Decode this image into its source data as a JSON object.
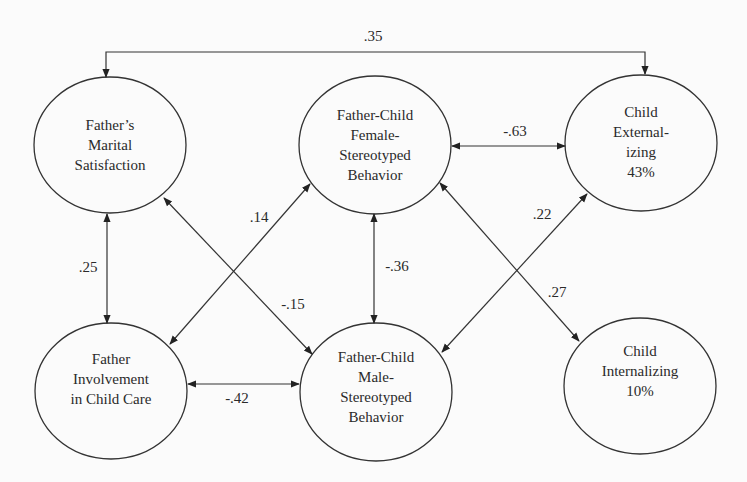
{
  "diagram": {
    "type": "path-model",
    "nodes": [
      {
        "id": "marital",
        "lines": [
          "Father’s",
          "Marital",
          "Satisfaction"
        ],
        "cx": 110,
        "cy": 145
      },
      {
        "id": "female",
        "lines": [
          "Father-Child",
          "Female-",
          "Stereotyped",
          "Behavior"
        ],
        "cx": 375,
        "cy": 145
      },
      {
        "id": "externalizing",
        "lines": [
          "Child",
          "External-",
          "izing",
          "43%"
        ],
        "cx": 641,
        "cy": 146
      },
      {
        "id": "involvement",
        "lines": [
          "Father",
          "Involvement",
          "in Child Care"
        ],
        "cx": 111,
        "cy": 390
      },
      {
        "id": "male",
        "lines": [
          "Father-Child",
          "Male-",
          "Stereotyped",
          "Behavior"
        ],
        "cx": 376,
        "cy": 390
      },
      {
        "id": "internalizing",
        "lines": [
          "Child",
          "Internalizing",
          "10%"
        ],
        "cx": 641,
        "cy": 385
      }
    ],
    "edges": [
      {
        "from": "marital",
        "to": "externalizing",
        "label": ".35",
        "type": "bidirectional",
        "lx": 373,
        "ly": 37
      },
      {
        "from": "female",
        "to": "externalizing",
        "label": "-.63",
        "type": "bidirectional",
        "lx": 517,
        "ly": 130
      },
      {
        "from": "marital",
        "to": "involvement",
        "label": ".25",
        "type": "bidirectional",
        "lx": 88,
        "ly": 268
      },
      {
        "from": "involvement",
        "to": "female",
        "label": ".14",
        "type": "bidirectional",
        "lx": 259,
        "ly": 217
      },
      {
        "from": "marital",
        "to": "male",
        "label": "-.15",
        "type": "bidirectional",
        "lx": 293,
        "ly": 305
      },
      {
        "from": "female",
        "to": "male",
        "label": "-.36",
        "type": "bidirectional",
        "lx": 397,
        "ly": 266
      },
      {
        "from": "involvement",
        "to": "male",
        "label": "-.42",
        "type": "bidirectional",
        "lx": 238,
        "ly": 398
      },
      {
        "from": "male",
        "to": "externalizing",
        "label": ".22",
        "type": "bidirectional",
        "lx": 542,
        "ly": 215
      },
      {
        "from": "female",
        "to": "internalizing",
        "label": ".27",
        "type": "bidirectional",
        "lx": 557,
        "ly": 293
      }
    ]
  }
}
